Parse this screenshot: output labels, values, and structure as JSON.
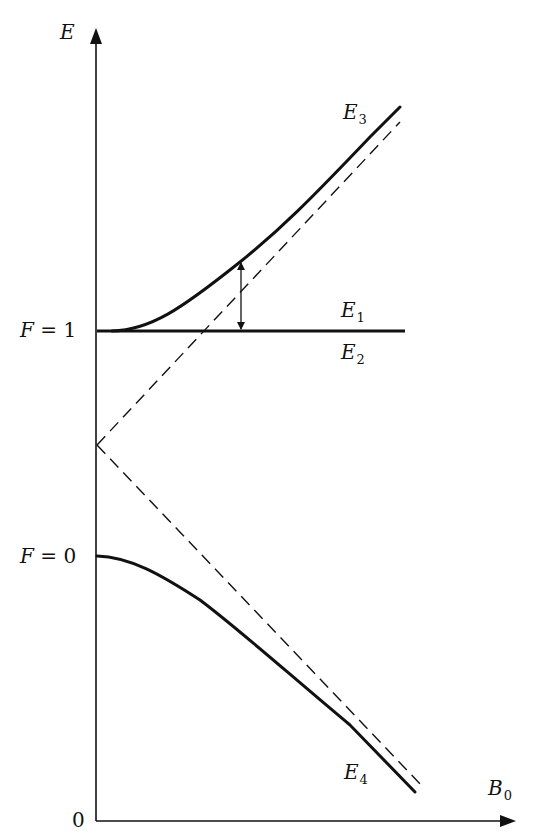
{
  "diagram": {
    "type": "energy-level-diagram",
    "axes": {
      "y_label": "E",
      "x_label": "B",
      "x_label_sub": "0",
      "origin_label": "0"
    },
    "levels": [
      {
        "name": "F1",
        "prefix": "F",
        "eq": "=",
        "value": "1"
      },
      {
        "name": "F0",
        "prefix": "F",
        "eq": "=",
        "value": "0"
      }
    ],
    "curves": [
      {
        "id": "E3",
        "label": "E",
        "sub": "3",
        "style": "solid"
      },
      {
        "id": "E1",
        "label": "E",
        "sub": "1",
        "style": "solid"
      },
      {
        "id": "E2",
        "label": "E",
        "sub": "2",
        "style": "solid"
      },
      {
        "id": "E4",
        "label": "E",
        "sub": "4",
        "style": "solid"
      }
    ],
    "asymptotes": [
      {
        "id": "upper-asymptote",
        "style": "dashed"
      },
      {
        "id": "lower-asymptote",
        "style": "dashed"
      }
    ],
    "annotation": {
      "id": "splitting-arrow",
      "style": "double-headed"
    },
    "colors": {
      "ink": "#111111",
      "background": "#ffffff"
    }
  }
}
